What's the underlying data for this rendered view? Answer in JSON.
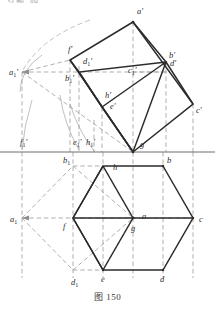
{
  "figure": {
    "caption": "图 150",
    "top_clipped_note": "习题 四",
    "type": "descriptive-geometry-orthographic-projection",
    "views": {
      "front": {
        "name": "front-view-V-projection",
        "shape": "tilted-parallelogram-prism",
        "description": "Front (V) projection of an inclined hexagonal prism shown as two overlapping parallelograms"
      },
      "top": {
        "name": "top-view-H-projection",
        "shape": "regular-hexagon",
        "description": "Top (H) projection: regular hexagon with centre point and interior triangulation"
      }
    },
    "ground_line": {
      "name": "XOX-ground-line",
      "y": 152
    },
    "colors": {
      "solid_line": "#2b2b2b",
      "dashed_line": "#8a8a8a",
      "arc_line": "#9a9a9a",
      "ground_line": "#6e6e6e",
      "label_text": "#2b2b2b",
      "caption_text": "#3a3a3a",
      "background": "#ffffff"
    },
    "labels": [
      {
        "id": "a-prime",
        "text": "a",
        "prime": "′",
        "sub": "",
        "x": 137,
        "y": 14
      },
      {
        "id": "f-prime",
        "text": "f",
        "prime": "′",
        "sub": "",
        "x": 68,
        "y": 52
      },
      {
        "id": "d1-prime",
        "text": "d",
        "prime": "′",
        "sub": "1",
        "x": 83,
        "y": 64
      },
      {
        "id": "b-prime",
        "text": "b",
        "prime": "′",
        "sub": "",
        "x": 169,
        "y": 58
      },
      {
        "id": "d-prime",
        "text": "d",
        "prime": "′",
        "sub": "",
        "x": 170,
        "y": 66
      },
      {
        "id": "a1-prime",
        "text": "a",
        "prime": "′",
        "sub": "1",
        "x": 9,
        "y": 75
      },
      {
        "id": "b1-prime",
        "text": "b",
        "prime": "′",
        "sub": "1",
        "x": 65,
        "y": 81
      },
      {
        "id": "c1-prime",
        "text": "c",
        "prime": "′",
        "sub": "1",
        "x": 128,
        "y": 73
      },
      {
        "id": "h-prime",
        "text": "h",
        "prime": "′",
        "sub": "",
        "x": 105,
        "y": 98
      },
      {
        "id": "e-prime",
        "text": "e",
        "prime": "′",
        "sub": "",
        "x": 110,
        "y": 109
      },
      {
        "id": "c-prime",
        "text": "c",
        "prime": "′",
        "sub": "",
        "x": 196,
        "y": 113
      },
      {
        "id": "f1-prime",
        "text": "f",
        "prime": "′",
        "sub": "1",
        "x": 20,
        "y": 145
      },
      {
        "id": "e1-prime",
        "text": "e",
        "prime": "′",
        "sub": "1",
        "x": 73,
        "y": 145
      },
      {
        "id": "h1-prime",
        "text": "h",
        "prime": "′",
        "sub": "1",
        "x": 86,
        "y": 145
      },
      {
        "id": "g-prime",
        "text": "g",
        "prime": "′",
        "sub": "",
        "x": 140,
        "y": 147
      },
      {
        "id": "b1-top",
        "text": "b",
        "prime": "",
        "sub": "1",
        "x": 63,
        "y": 163
      },
      {
        "id": "h-top",
        "text": "h",
        "prime": "",
        "sub": "",
        "x": 113,
        "y": 170
      },
      {
        "id": "b-top",
        "text": "b",
        "prime": "",
        "sub": "",
        "x": 167,
        "y": 163
      },
      {
        "id": "a1-top",
        "text": "a",
        "prime": "",
        "sub": "1",
        "x": 10,
        "y": 222
      },
      {
        "id": "f-top",
        "text": "f",
        "prime": "",
        "sub": "",
        "x": 63,
        "y": 229
      },
      {
        "id": "a-top",
        "text": "a",
        "prime": "",
        "sub": "",
        "x": 142,
        "y": 219
      },
      {
        "id": "g-top",
        "text": "g",
        "prime": "",
        "sub": "",
        "x": 131,
        "y": 231
      },
      {
        "id": "c-top",
        "text": "c",
        "prime": "",
        "sub": "",
        "x": 199,
        "y": 222
      },
      {
        "id": "d1-top",
        "text": "d",
        "prime": "",
        "sub": "1",
        "x": 71,
        "y": 285
      },
      {
        "id": "e-top",
        "text": "e",
        "prime": "",
        "sub": "",
        "x": 101,
        "y": 282
      },
      {
        "id": "d-top",
        "text": "d",
        "prime": "",
        "sub": "",
        "x": 160,
        "y": 282
      }
    ],
    "points": {
      "front": {
        "a_prime": [
          133,
          22
        ],
        "f_prime": [
          70,
          60
        ],
        "c_prime": [
          193,
          104
        ],
        "g_prime": [
          133,
          152
        ],
        "d_prime": [
          166,
          62
        ],
        "b_prime": [
          166,
          62
        ],
        "d1_prime": [
          79,
          72
        ],
        "e_prime": [
          102,
          107
        ],
        "h_prime": [
          102,
          107
        ],
        "c1_prime": [
          133,
          72
        ],
        "a1_prime": [
          22,
          72
        ],
        "b1_prime": [
          79,
          72
        ],
        "f1_prime": [
          22,
          152
        ],
        "e1_prime": [
          79,
          152
        ],
        "h1_prime": [
          94,
          152
        ],
        "g1_prime": [
          133,
          152
        ]
      },
      "top": {
        "a": [
          133,
          218
        ],
        "b": [
          163,
          166
        ],
        "c": [
          193,
          218
        ],
        "d": [
          163,
          270
        ],
        "e": [
          103,
          270
        ],
        "f": [
          73,
          218
        ],
        "g": [
          133,
          218
        ],
        "h": [
          103,
          166
        ],
        "a1": [
          22,
          218
        ],
        "b1": [
          73,
          166
        ],
        "d1": [
          73,
          270
        ]
      }
    }
  }
}
